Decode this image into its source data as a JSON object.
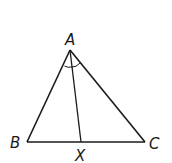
{
  "diagram": {
    "type": "triangle-angle-bisector",
    "stroke_color": "#1a1a1a",
    "background": "#ffffff",
    "vertices": {
      "A": {
        "label": "A",
        "x": 70,
        "y": 50
      },
      "B": {
        "label": "B",
        "x": 27,
        "y": 142
      },
      "C": {
        "label": "C",
        "x": 145,
        "y": 142
      },
      "X": {
        "label": "X",
        "x": 81,
        "y": 142
      }
    },
    "segments": [
      "AB",
      "AC",
      "BC",
      "AX"
    ],
    "angle_marks": [
      {
        "vertex": "A",
        "between": [
          "AB",
          "AX"
        ],
        "arcs": 1
      },
      {
        "vertex": "A",
        "between": [
          "AX",
          "AC"
        ],
        "arcs": 1
      }
    ]
  }
}
